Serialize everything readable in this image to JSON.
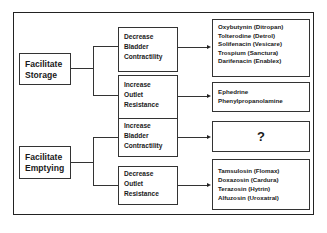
{
  "diagram": {
    "top_cut_text": "",
    "roots": [
      {
        "label_line1": "Facilitate",
        "label_line2": "Storage",
        "branches": [
          {
            "label_lines": [
              "Decrease",
              "Bladder",
              "Contractility"
            ],
            "drugs": [
              "Oxybutynin (Ditropan)",
              "Tolterodine (Detrol)",
              "Solifenacin (Vesicare)",
              "Trospium (Sanctura)",
              "Darifenacin (Enablex)"
            ]
          },
          {
            "label_lines": [
              "Increase",
              "Outlet",
              "Resistance"
            ],
            "drugs": [
              "Ephedrine",
              "Phenylpropanolamine"
            ]
          }
        ]
      },
      {
        "label_line1": "Facilitate",
        "label_line2": "Emptying",
        "branches": [
          {
            "label_lines": [
              "Increase",
              "Bladder",
              "Contractility"
            ],
            "unknown": "?"
          },
          {
            "label_lines": [
              "Decrease",
              "Outlet",
              "Resistance"
            ],
            "drugs": [
              "Tamsulosin (Flomax)",
              "Doxazosin (Cardura)",
              "Terazosin (Hytrin)",
              "Alfuzosin (Uroxatral)"
            ]
          }
        ]
      }
    ]
  }
}
